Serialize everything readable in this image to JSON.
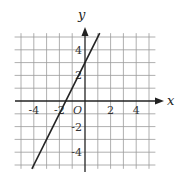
{
  "chart_data": {
    "type": "line",
    "title": "",
    "xlabel": "x",
    "ylabel": "y",
    "origin_label": "O",
    "xlim": [
      -5.5,
      5.5
    ],
    "ylim": [
      -5.3,
      5.3
    ],
    "grid": true,
    "grid_step": 1,
    "x_tick_labels": [
      "-4",
      "-2",
      "2",
      "4"
    ],
    "x_tick_values": [
      -4,
      -2,
      2,
      4
    ],
    "y_tick_labels": [
      "4",
      "2",
      "-2",
      "-4"
    ],
    "y_tick_values": [
      4,
      2,
      -2,
      -4
    ],
    "series": [
      {
        "name": "line",
        "equation": "y = 2x + 3",
        "slope": 2,
        "intercept": 3,
        "x": [
          -4.15,
          1.15
        ],
        "y": [
          -5.3,
          5.3
        ]
      }
    ],
    "colors": {
      "grid": "#9a9a9a",
      "axis": "#222222",
      "line": "#222222"
    }
  }
}
